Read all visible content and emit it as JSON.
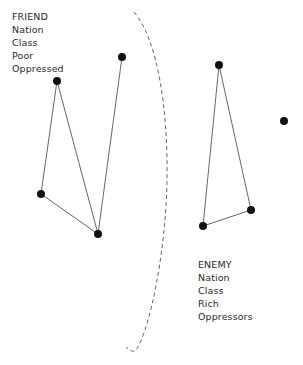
{
  "friend": {
    "lines": [
      "FRIEND",
      "Nation",
      "Class",
      "Poor",
      "Oppressed"
    ]
  },
  "enemy": {
    "lines": [
      "ENEMY",
      "Nation",
      "Class",
      "Rich",
      "Oppressors"
    ]
  },
  "graph": {
    "friend_nodes": [
      "friend-node-1",
      "friend-node-2",
      "friend-node-3",
      "friend-node-4"
    ],
    "friend_edges": [
      [
        "friend-node-1",
        "friend-node-2"
      ],
      [
        "friend-node-2",
        "friend-node-3"
      ],
      [
        "friend-node-1",
        "friend-node-3"
      ],
      [
        "friend-node-3",
        "friend-node-4"
      ]
    ],
    "enemy_nodes": [
      "enemy-node-1",
      "enemy-node-2",
      "enemy-node-3",
      "enemy-node-isolated"
    ],
    "enemy_edges": [
      [
        "enemy-node-1",
        "enemy-node-2"
      ],
      [
        "enemy-node-1",
        "enemy-node-3"
      ],
      [
        "enemy-node-2",
        "enemy-node-3"
      ]
    ],
    "divider": "dashed-boundary"
  },
  "colors": {
    "node": "#111111",
    "edge": "#555555",
    "divider": "#666666",
    "text": "#2a2a2a"
  }
}
